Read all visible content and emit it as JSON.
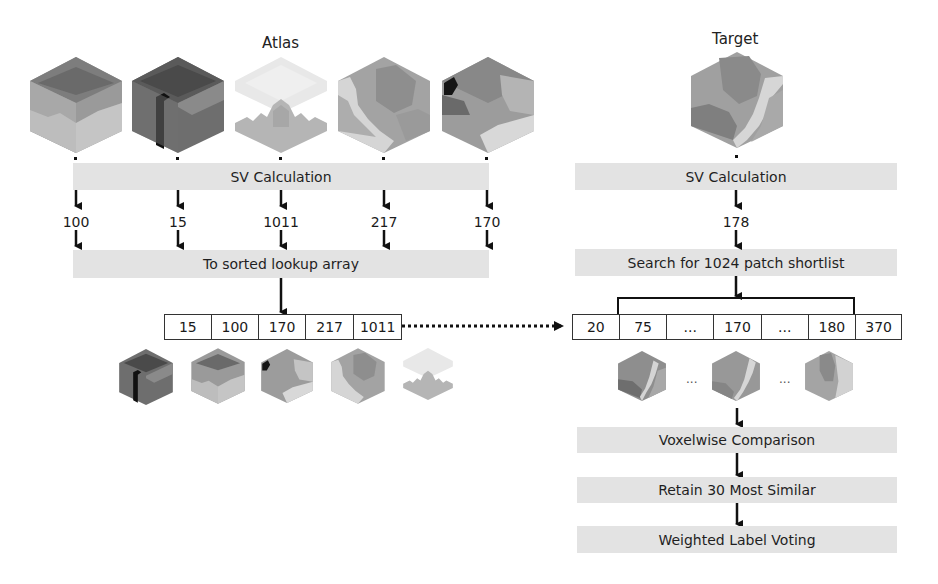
{
  "atlas": {
    "title": "Atlas",
    "sv_label": "SV Calculation",
    "sv_values": [
      "100",
      "15",
      "1011",
      "217",
      "170"
    ],
    "lookup_label": "To sorted lookup array",
    "sorted_array": [
      "15",
      "100",
      "170",
      "217",
      "1011"
    ]
  },
  "target": {
    "title": "Target",
    "sv_label": "SV Calculation",
    "sv_value": "178",
    "search_label": "Search for 1024 patch shortlist",
    "array": [
      "20",
      "75",
      "...",
      "170",
      "...",
      "180",
      "370"
    ],
    "ellipsis": "...",
    "steps": [
      "Voxelwise Comparison",
      "Retain 30 Most Similar",
      "Weighted Label Voting"
    ]
  },
  "colors": {
    "band": "#e3e3e3",
    "line": "#1a1a1a",
    "cube_dark": "#5a5a5a",
    "cube_mid": "#8c8c8c",
    "cube_light": "#b8b8b8",
    "cube_pale": "#dcdcdc"
  }
}
